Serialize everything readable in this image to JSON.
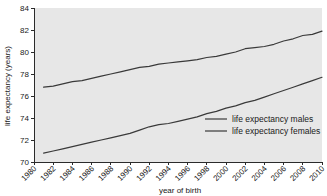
{
  "chart_data": {
    "type": "line",
    "title": "",
    "xlabel": "year of birth",
    "ylabel": "life expectancy (years)",
    "xlim": [
      1980,
      2010
    ],
    "ylim": [
      70,
      84
    ],
    "xticks": [
      1980,
      1982,
      1984,
      1986,
      1988,
      1990,
      1992,
      1994,
      1996,
      1998,
      2000,
      2002,
      2004,
      2006,
      2008,
      2010
    ],
    "yticks": [
      70,
      72,
      74,
      76,
      78,
      80,
      82,
      84
    ],
    "xtick_labels": [
      "1980",
      "1982",
      "1984",
      "1986",
      "1988",
      "1990",
      "1992",
      "1994",
      "1996",
      "1998",
      "2000",
      "2002",
      "2004",
      "2006",
      "2008",
      "2010"
    ],
    "ytick_labels": [
      "70",
      "72",
      "74",
      "76",
      "78",
      "80",
      "82",
      "84"
    ],
    "grid": false,
    "legend_position": "lower right",
    "plot_background": "#e7e7e7",
    "line_color": "#3a3a3a",
    "x": [
      1981,
      1982,
      1983,
      1984,
      1985,
      1986,
      1987,
      1988,
      1989,
      1990,
      1991,
      1992,
      1993,
      1994,
      1995,
      1996,
      1997,
      1998,
      1999,
      2000,
      2001,
      2002,
      2003,
      2004,
      2005,
      2006,
      2007,
      2008,
      2009,
      2010
    ],
    "series": [
      {
        "name": "life expectancy females",
        "label": "life expectancy females",
        "values": [
          76.8,
          76.9,
          77.1,
          77.3,
          77.4,
          77.6,
          77.8,
          78.0,
          78.2,
          78.4,
          78.6,
          78.7,
          78.9,
          79.0,
          79.1,
          79.2,
          79.3,
          79.5,
          79.6,
          79.8,
          80.0,
          80.3,
          80.4,
          80.5,
          80.7,
          81.0,
          81.2,
          81.5,
          81.6,
          81.9
        ]
      },
      {
        "name": "life expectancy males",
        "label": "life expectancy males",
        "values": [
          70.8,
          71.0,
          71.2,
          71.4,
          71.6,
          71.8,
          72.0,
          72.2,
          72.4,
          72.6,
          72.9,
          73.2,
          73.4,
          73.5,
          73.7,
          73.9,
          74.1,
          74.4,
          74.6,
          74.9,
          75.1,
          75.4,
          75.6,
          75.9,
          76.2,
          76.5,
          76.8,
          77.1,
          77.4,
          77.7
        ]
      }
    ],
    "legend_entries": [
      {
        "label": "life expectancy males"
      },
      {
        "label": "life expectancy females"
      }
    ]
  }
}
